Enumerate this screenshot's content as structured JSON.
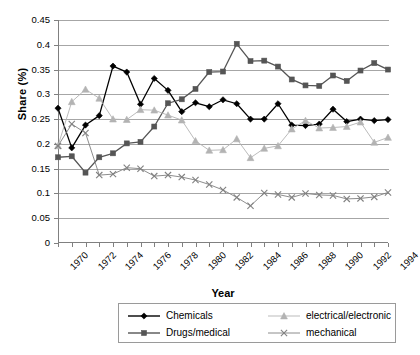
{
  "chart_data": {
    "type": "line",
    "title": "",
    "xlabel": "Year",
    "ylabel": "Share (%)",
    "xlim": [
      1970,
      1994
    ],
    "ylim": [
      0,
      0.45
    ],
    "ytick_labels": [
      "0",
      "0.05",
      "0.1",
      "0.15",
      "0.2",
      "0.25",
      "0.3",
      "0.35",
      "0.4",
      "0.45"
    ],
    "ytick_values": [
      0,
      0.05,
      0.1,
      0.15,
      0.2,
      0.25,
      0.3,
      0.35,
      0.4,
      0.45
    ],
    "xtick_labels": [
      "1970",
      "1972",
      "1974",
      "1976",
      "1978",
      "1980",
      "1982",
      "1984",
      "1986",
      "1988",
      "1990",
      "1992",
      "1994"
    ],
    "xtick_values": [
      1970,
      1972,
      1974,
      1976,
      1978,
      1980,
      1982,
      1984,
      1986,
      1988,
      1990,
      1992,
      1994
    ],
    "grid": "horizontal",
    "legend_position": "bottom",
    "x": [
      1970,
      1971,
      1972,
      1973,
      1974,
      1975,
      1976,
      1977,
      1978,
      1979,
      1980,
      1981,
      1982,
      1983,
      1984,
      1985,
      1986,
      1987,
      1988,
      1989,
      1990,
      1991,
      1992,
      1993,
      1994
    ],
    "series": [
      {
        "name": "Chemicals",
        "color": "#000000",
        "marker": "diamond",
        "values": [
          0.272,
          0.192,
          0.238,
          0.257,
          0.357,
          0.345,
          0.28,
          0.332,
          0.308,
          0.265,
          0.283,
          0.275,
          0.289,
          0.281,
          0.25,
          0.25,
          0.281,
          0.238,
          0.237,
          0.24,
          0.27,
          0.245,
          0.25,
          0.247,
          0.249
        ]
      },
      {
        "name": "Drugs/medical",
        "color": "#555555",
        "marker": "square",
        "values": [
          0.173,
          0.175,
          0.142,
          0.173,
          0.181,
          0.201,
          0.204,
          0.235,
          0.282,
          0.29,
          0.311,
          0.345,
          0.346,
          0.402,
          0.367,
          0.368,
          0.356,
          0.33,
          0.318,
          0.317,
          0.338,
          0.327,
          0.348,
          0.363,
          0.35
        ]
      },
      {
        "name": "electrical/electronic",
        "color": "#b3b3b3",
        "marker": "triangle",
        "values": [
          0.196,
          0.285,
          0.31,
          0.292,
          0.25,
          0.249,
          0.269,
          0.268,
          0.258,
          0.248,
          0.206,
          0.187,
          0.188,
          0.21,
          0.172,
          0.191,
          0.196,
          0.23,
          0.247,
          0.232,
          0.233,
          0.235,
          0.244,
          0.203,
          0.213
        ]
      },
      {
        "name": "mechanical",
        "color": "#808080",
        "marker": "cross",
        "values": [
          0.196,
          0.24,
          0.222,
          0.137,
          0.139,
          0.152,
          0.15,
          0.135,
          0.137,
          0.133,
          0.127,
          0.118,
          0.107,
          0.092,
          0.075,
          0.101,
          0.098,
          0.092,
          0.1,
          0.097,
          0.096,
          0.089,
          0.09,
          0.093,
          0.102
        ]
      }
    ]
  },
  "axes": {
    "y_title": "Share (%)",
    "x_title": "Year"
  },
  "legend": {
    "entries": [
      {
        "label": "Chemicals",
        "marker": "diamond-icon",
        "color": "#000000"
      },
      {
        "label": "electrical/electronic",
        "marker": "triangle-icon",
        "color": "#b3b3b3"
      },
      {
        "label": "Drugs/medical",
        "marker": "square-icon",
        "color": "#555555"
      },
      {
        "label": "mechanical",
        "marker": "cross-icon",
        "color": "#808080"
      }
    ]
  }
}
